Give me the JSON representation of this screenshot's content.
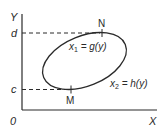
{
  "diagram": {
    "axes": {
      "y_label": "Y",
      "x_label": "X",
      "origin_label": "0"
    },
    "levels": {
      "upper": "d",
      "lower": "c"
    },
    "points": {
      "top": "N",
      "bottom": "M"
    },
    "curves": {
      "left_var": "x",
      "left_sub": "1",
      "left_rhs": " = g(y)",
      "right_var": "x",
      "right_sub": "2",
      "right_rhs": " = h(y)"
    },
    "colors": {
      "stroke": "#2a2a2a",
      "background": "#ffffff"
    }
  }
}
